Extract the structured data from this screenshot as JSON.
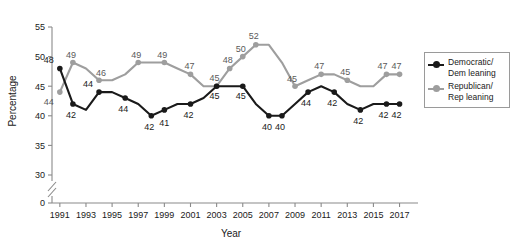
{
  "chart_data": {
    "type": "line",
    "title": "",
    "xlabel": "Year",
    "ylabel": "Percentage",
    "xlim": [
      1990.4,
      2017.8
    ],
    "ylim": [
      28.5,
      55
    ],
    "yticks": [
      0,
      30,
      35,
      40,
      45,
      50,
      55
    ],
    "ytick_labels": [
      "0",
      "30",
      "35",
      "40",
      "45",
      "50",
      "55"
    ],
    "axis_break": true,
    "grid": false,
    "legend_position": "right",
    "x": [
      1991,
      1992,
      1993,
      1994,
      1995,
      1996,
      1997,
      1998,
      1999,
      2000,
      2001,
      2002,
      2003,
      2004,
      2005,
      2006,
      2007,
      2008,
      2009,
      2010,
      2011,
      2012,
      2013,
      2014,
      2015,
      2016,
      2017
    ],
    "xtick_labels": [
      "1991",
      "1993",
      "1995",
      "1997",
      "1999",
      "2001",
      "2003",
      "2005",
      "2007",
      "2009",
      "2011",
      "2013",
      "2015",
      "2017"
    ],
    "xticks": [
      1991,
      1993,
      1995,
      1997,
      1999,
      2001,
      2003,
      2005,
      2007,
      2009,
      2011,
      2013,
      2015,
      2017
    ],
    "series": [
      {
        "name": "Democratic/\nDem leaning",
        "color": "#1a1a1a",
        "values": [
          48,
          42,
          41,
          44,
          44,
          43,
          42,
          40,
          41,
          42,
          42,
          43,
          45,
          45,
          45,
          42,
          40,
          40,
          42,
          44,
          45,
          44,
          42,
          41,
          42,
          42,
          42
        ],
        "labels": [
          {
            "x": 1991,
            "v": "48",
            "dx": -11,
            "dy": -5
          },
          {
            "x": 1992,
            "v": "42",
            "dx": -2,
            "dy": 14
          },
          {
            "x": 1994,
            "v": "44",
            "dx": -11,
            "dy": -5
          },
          {
            "x": 1996,
            "v": "44",
            "dx": -2,
            "dy": 14
          },
          {
            "x": 1998,
            "v": "42",
            "dx": -2,
            "dy": 14
          },
          {
            "x": 1999,
            "v": "41",
            "dx": 0,
            "dy": 16
          },
          {
            "x": 2001,
            "v": "42",
            "dx": -2,
            "dy": 14
          },
          {
            "x": 2003,
            "v": "45",
            "dx": -2,
            "dy": 13
          },
          {
            "x": 2005,
            "v": "45",
            "dx": -2,
            "dy": 13
          },
          {
            "x": 2007,
            "v": "40",
            "dx": -2,
            "dy": 14
          },
          {
            "x": 2008,
            "v": "40",
            "dx": -2,
            "dy": 14
          },
          {
            "x": 2010,
            "v": "44",
            "dx": -2,
            "dy": 14
          },
          {
            "x": 2012,
            "v": "42",
            "dx": -2,
            "dy": 14
          },
          {
            "x": 2014,
            "v": "42",
            "dx": -2,
            "dy": 14
          },
          {
            "x": 2016,
            "v": "42",
            "dx": -3,
            "dy": 14
          },
          {
            "x": 2017,
            "v": "42",
            "dx": -3,
            "dy": 14
          }
        ]
      },
      {
        "name": "Republican/\nRep leaning",
        "color": "#9e9e9e",
        "values": [
          44,
          49,
          48,
          46,
          46,
          47,
          49,
          49,
          49,
          48,
          47,
          45,
          45,
          48,
          50,
          52,
          52,
          49,
          45,
          46,
          47,
          47,
          46,
          45,
          45,
          47,
          47
        ],
        "labels": [
          {
            "x": 1991,
            "v": "44",
            "dx": -11,
            "dy": 13
          },
          {
            "x": 1992,
            "v": "49",
            "dx": -2,
            "dy": -5
          },
          {
            "x": 1994,
            "v": "46",
            "dx": 2,
            "dy": -4
          },
          {
            "x": 1997,
            "v": "49",
            "dx": -2,
            "dy": -5
          },
          {
            "x": 1999,
            "v": "49",
            "dx": -2,
            "dy": -5
          },
          {
            "x": 2001,
            "v": "47",
            "dx": -1,
            "dy": -5
          },
          {
            "x": 2003,
            "v": "45",
            "dx": -2,
            "dy": -5
          },
          {
            "x": 2004,
            "v": "48",
            "dx": -2,
            "dy": -5
          },
          {
            "x": 2005,
            "v": "50",
            "dx": -2,
            "dy": -5
          },
          {
            "x": 2006,
            "v": "52",
            "dx": -2,
            "dy": -6
          },
          {
            "x": 2009,
            "v": "45",
            "dx": -3,
            "dy": -4
          },
          {
            "x": 2011,
            "v": "47",
            "dx": -2,
            "dy": -5
          },
          {
            "x": 2013,
            "v": "45",
            "dx": -2,
            "dy": -5
          },
          {
            "x": 2016,
            "v": "47",
            "dx": -4,
            "dy": -5
          },
          {
            "x": 2017,
            "v": "47",
            "dx": -3,
            "dy": -5
          }
        ]
      }
    ]
  },
  "legend": {
    "items": [
      {
        "label": "Democratic/\nDem leaning",
        "color": "#1a1a1a"
      },
      {
        "label": "Republican/\nRep leaning",
        "color": "#9e9e9e"
      }
    ]
  }
}
